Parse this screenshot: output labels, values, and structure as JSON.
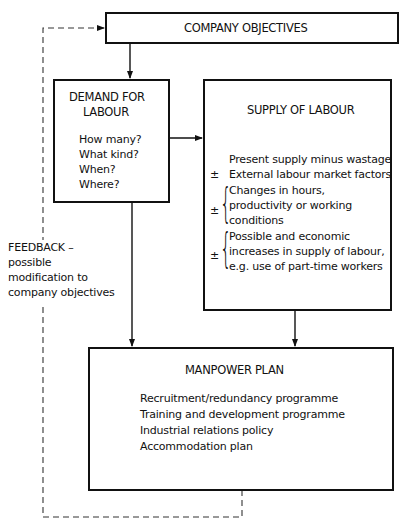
{
  "diagram": {
    "company_objectives": {
      "title": "COMPANY OBJECTIVES"
    },
    "demand": {
      "title_line1": "DEMAND FOR",
      "title_line2": "LABOUR",
      "questions": [
        "How many?",
        "What kind?",
        "When?",
        "Where?"
      ]
    },
    "supply": {
      "title": "SUPPLY OF LABOUR",
      "line1": "Present supply minus wastage",
      "item2": {
        "sign": "±",
        "text": "External labour market factors"
      },
      "item3": {
        "sign": "±",
        "lines": [
          "Changes in hours,",
          "productivity or working",
          "conditions"
        ]
      },
      "item4": {
        "sign": "±",
        "lines": [
          "Possible and economic",
          "increases in supply of labour,",
          "e.g. use of part-time workers"
        ]
      }
    },
    "feedback": {
      "lines": [
        "FEEDBACK –",
        "possible",
        "modification to",
        "company objectives"
      ]
    },
    "manpower_plan": {
      "title": "MANPOWER PLAN",
      "items": [
        "Recruitment/redundancy programme",
        "Training and development programme",
        "Industrial relations policy",
        "Accommodation plan"
      ]
    },
    "connections": [
      {
        "from": "company_objectives",
        "to": "demand",
        "style": "solid-arrow"
      },
      {
        "from": "demand",
        "to": "supply",
        "style": "solid-arrow"
      },
      {
        "from": "demand",
        "to": "manpower_plan",
        "style": "solid-arrow"
      },
      {
        "from": "supply",
        "to": "manpower_plan",
        "style": "solid-arrow"
      },
      {
        "from": "manpower_plan",
        "to": "company_objectives",
        "style": "dashed-arrow",
        "label": "feedback"
      }
    ],
    "colors": {
      "line": "#111111",
      "background": "#ffffff"
    }
  }
}
